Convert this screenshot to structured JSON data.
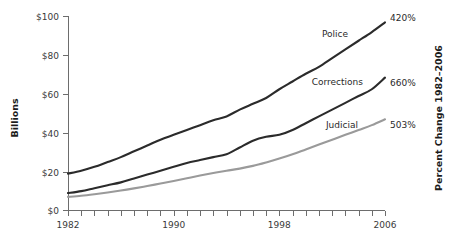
{
  "chart_data": {
    "type": "line",
    "title": "",
    "xlabel": "",
    "ylabel": "Billions",
    "y2label": "Percent Change 1982–2006",
    "grid": false,
    "legend_position": "inline-right",
    "xlim": [
      1982,
      2006
    ],
    "ylim": [
      0,
      100
    ],
    "x": [
      1982,
      1983,
      1984,
      1985,
      1986,
      1987,
      1988,
      1989,
      1990,
      1991,
      1992,
      1993,
      1994,
      1995,
      1996,
      1997,
      1998,
      1999,
      2000,
      2001,
      2002,
      2003,
      2004,
      2005,
      2006
    ],
    "xticklabels": [
      "1982",
      "1990",
      "1998",
      "2006"
    ],
    "xticklabel_values": [
      1982,
      1990,
      1998,
      2006
    ],
    "yticklabels": [
      "$0",
      "$20",
      "$40",
      "$60",
      "$80",
      "$100"
    ],
    "ytick_values": [
      0,
      20,
      40,
      60,
      80,
      100
    ],
    "series": [
      {
        "name": "Police",
        "label": "Police",
        "value_label": "420%",
        "color": "#2b2b2b",
        "values": [
          19.0,
          20.5,
          22.5,
          25.0,
          27.5,
          30.5,
          33.5,
          36.5,
          39.0,
          41.5,
          44.0,
          46.5,
          48.5,
          52.0,
          55.0,
          58.0,
          62.5,
          66.5,
          70.5,
          74.0,
          78.5,
          83.0,
          87.5,
          92.0,
          97.0
        ]
      },
      {
        "name": "Corrections",
        "label": "Corrections",
        "value_label": "660%",
        "color": "#2b2b2b",
        "values": [
          9.0,
          10.0,
          11.5,
          13.0,
          14.5,
          16.5,
          18.5,
          20.5,
          22.5,
          24.5,
          26.0,
          27.5,
          29.0,
          32.5,
          36.0,
          38.0,
          39.0,
          41.5,
          45.0,
          48.5,
          52.0,
          55.5,
          59.0,
          62.5,
          68.5
        ]
      },
      {
        "name": "Judicial",
        "label": "Judicial",
        "value_label": "503%",
        "color": "#9a9a9a",
        "values": [
          7.0,
          7.6,
          8.4,
          9.3,
          10.3,
          11.4,
          12.6,
          13.9,
          15.2,
          16.6,
          18.0,
          19.3,
          20.5,
          21.6,
          23.0,
          24.8,
          26.8,
          29.0,
          31.5,
          34.0,
          36.5,
          39.0,
          41.5,
          44.0,
          47.0
        ]
      }
    ]
  },
  "axes": {
    "y_title": "Billions",
    "y2_title": "Percent Change 1982–2006"
  }
}
